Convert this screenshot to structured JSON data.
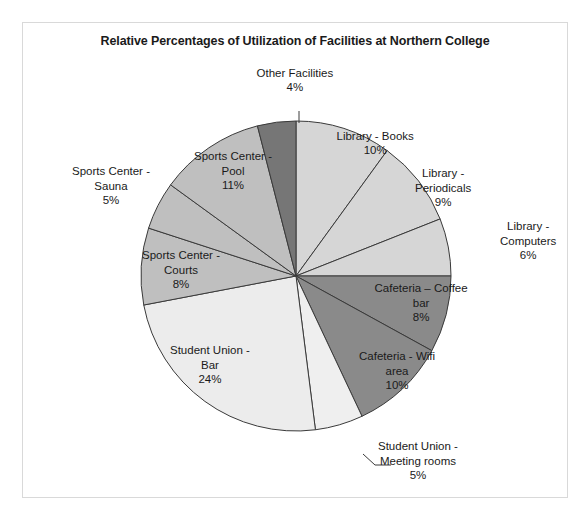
{
  "chart_data": {
    "type": "pie",
    "title": "Relative Percentages of Utilization of Facilities at Northern College",
    "xlabel": "",
    "ylabel": "",
    "legend_position": "none",
    "grid": false,
    "units": "percent",
    "total": 100,
    "start_angle_deg": 0,
    "direction": "clockwise",
    "categories": [
      "Library - Books",
      "Library - Periodicals",
      "Library - Computers",
      "Cafeteria – Coffee bar",
      "Cafeteria - Wifi area",
      "Student Union - Meeting rooms",
      "Student Union - Bar",
      "Sports Center - Courts",
      "Sports Center - Sauna",
      "Sports Center - Pool",
      "Other Facilities"
    ],
    "values": [
      10,
      9,
      6,
      8,
      10,
      5,
      24,
      8,
      5,
      11,
      4
    ],
    "colors": [
      "#d6d6d6",
      "#d6d6d6",
      "#d6d6d6",
      "#8a8a8a",
      "#8a8a8a",
      "#efefef",
      "#ececec",
      "#bfbfbf",
      "#bfbfbf",
      "#bfbfbf",
      "#767676"
    ],
    "slices": [
      {
        "label": "Library - Books",
        "value": 10,
        "value_text": "10%",
        "label_lines": [
          "Library - Books",
          "10%"
        ],
        "color": "#d6d6d6",
        "placement": "inside"
      },
      {
        "label": "Library - Periodicals",
        "value": 9,
        "value_text": "9%",
        "label_lines": [
          "Library -",
          "Periodicals",
          "9%"
        ],
        "color": "#d6d6d6",
        "placement": "inside"
      },
      {
        "label": "Library - Computers",
        "value": 6,
        "value_text": "6%",
        "label_lines": [
          "Library -",
          "Computers",
          "6%"
        ],
        "color": "#d6d6d6",
        "placement": "outside"
      },
      {
        "label": "Cafeteria – Coffee bar",
        "value": 8,
        "value_text": "8%",
        "label_lines": [
          "Cafeteria – Coffee",
          "bar",
          "8%"
        ],
        "color": "#8a8a8a",
        "placement": "inside"
      },
      {
        "label": "Cafeteria - Wifi area",
        "value": 10,
        "value_text": "10%",
        "label_lines": [
          "Cafeteria - Wifi",
          "area",
          "10%"
        ],
        "color": "#8a8a8a",
        "placement": "inside"
      },
      {
        "label": "Student Union - Meeting rooms",
        "value": 5,
        "value_text": "5%",
        "label_lines": [
          "Student Union -",
          "Meeting rooms",
          "5%"
        ],
        "color": "#efefef",
        "placement": "outside"
      },
      {
        "label": "Student Union - Bar",
        "value": 24,
        "value_text": "24%",
        "label_lines": [
          "Student Union -",
          "Bar",
          "24%"
        ],
        "color": "#ececec",
        "placement": "inside"
      },
      {
        "label": "Sports Center - Courts",
        "value": 8,
        "value_text": "8%",
        "label_lines": [
          "Sports Center -",
          "Courts",
          "8%"
        ],
        "color": "#bfbfbf",
        "placement": "inside"
      },
      {
        "label": "Sports Center - Sauna",
        "value": 5,
        "value_text": "5%",
        "label_lines": [
          "Sports Center -",
          "Sauna",
          "5%"
        ],
        "color": "#bfbfbf",
        "placement": "outside"
      },
      {
        "label": "Sports Center - Pool",
        "value": 11,
        "value_text": "11%",
        "label_lines": [
          "Sports Center -",
          "Pool",
          "11%"
        ],
        "color": "#bfbfbf",
        "placement": "inside"
      },
      {
        "label": "Other Facilities",
        "value": 4,
        "value_text": "4%",
        "label_lines": [
          "Other Facilities",
          "4%"
        ],
        "color": "#767676",
        "placement": "outside"
      }
    ]
  },
  "geometry": {
    "center_x": 273,
    "center_y": 253,
    "radius": 155,
    "label_positions": [
      {
        "x": 352,
        "y": 120,
        "anchor": "center"
      },
      {
        "x": 420,
        "y": 165,
        "anchor": "center"
      },
      {
        "x": 505,
        "y": 218,
        "anchor": "center"
      },
      {
        "x": 398,
        "y": 280,
        "anchor": "center"
      },
      {
        "x": 374,
        "y": 348,
        "anchor": "center"
      },
      {
        "x": 395,
        "y": 438,
        "anchor": "center"
      },
      {
        "x": 187,
        "y": 342,
        "anchor": "center"
      },
      {
        "x": 158,
        "y": 247,
        "anchor": "center"
      },
      {
        "x": 88,
        "y": 163,
        "anchor": "center"
      },
      {
        "x": 210,
        "y": 148,
        "anchor": "center"
      },
      {
        "x": 272,
        "y": 57,
        "anchor": "center"
      }
    ],
    "leader_lines": [
      {
        "name": "leader-student-union-meeting-rooms",
        "points": "340,431 352,442 368,442"
      },
      {
        "name": "leader-other-facilities",
        "points": "276,88 276,100"
      }
    ]
  },
  "frame": {
    "border_color": "#d9d9d9",
    "background": "#ffffff"
  }
}
